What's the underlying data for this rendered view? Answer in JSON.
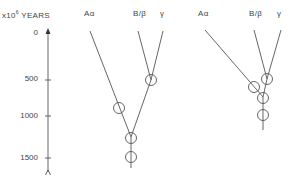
{
  "axis": {
    "unit_prefix": "x10",
    "unit_exp": "6",
    "unit_suffix": " YEARS",
    "ticks": [
      {
        "label": "0",
        "y": 33
      },
      {
        "label": "500",
        "y": 80
      },
      {
        "label": "1000",
        "y": 116
      },
      {
        "label": "1500",
        "y": 158
      }
    ]
  },
  "left_tree": {
    "headers": {
      "a": "Aα",
      "b": "B/β",
      "g": "γ"
    }
  },
  "right_tree": {
    "headers": {
      "a": "Aα",
      "b": "B/β",
      "g": "γ"
    }
  },
  "colors": {
    "line": "#555555",
    "text": "#444444",
    "background": "#ffffff"
  }
}
